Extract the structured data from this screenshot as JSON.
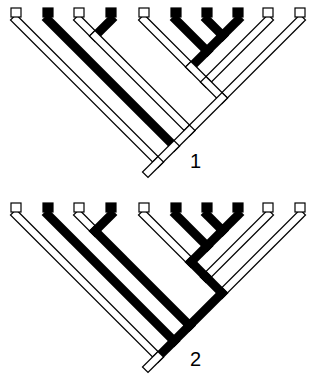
{
  "figure": {
    "type": "cladogram-comparison",
    "colors": {
      "derived": "#000000",
      "ancestral": "#ffffff",
      "outline": "#000000"
    },
    "legend_note": "Filled squares = derived state; open squares = ancestral state"
  },
  "trees": [
    {
      "label": "1",
      "tips": [
        "open",
        "filled",
        "open",
        "filled",
        "open",
        "filled",
        "filled",
        "filled",
        "open",
        "open"
      ],
      "tip_x": [
        16,
        48,
        79,
        111,
        144,
        176,
        207,
        238,
        268,
        300
      ],
      "top_y": 13,
      "root": {
        "x": 145,
        "y": 178
      },
      "label_pos": {
        "x": 190,
        "y": 152
      }
    },
    {
      "label": "2",
      "tips": [
        "open",
        "filled",
        "open",
        "filled",
        "open",
        "filled",
        "filled",
        "filled",
        "open",
        "open"
      ],
      "tip_x": [
        16,
        48,
        79,
        111,
        144,
        176,
        207,
        238,
        268,
        300
      ],
      "top_y": 208,
      "root": {
        "x": 145,
        "y": 373
      },
      "label_pos": {
        "x": 190,
        "y": 350
      }
    }
  ]
}
